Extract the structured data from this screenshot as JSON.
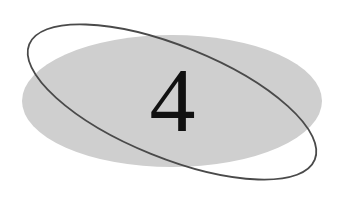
{
  "chapter": {
    "number": "4"
  },
  "colors": {
    "background": "#ffffff",
    "fill_ellipse": "#cfcfcf",
    "outline_ellipse": "#4a4a4a",
    "numeral": "#111111"
  }
}
